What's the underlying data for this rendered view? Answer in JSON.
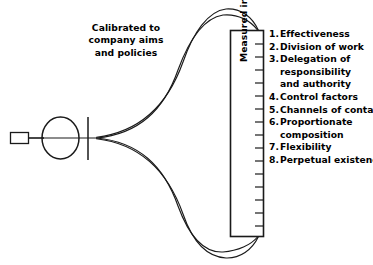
{
  "diagram": {
    "caption": {
      "lines": [
        "Calibrated to",
        "company aims",
        "and policies"
      ],
      "full_text": "Calibrated to company aims and policies"
    },
    "scale_box": {
      "vertical_label": "Measured in terms of objectives",
      "tick_count": 15
    },
    "objectives": [
      {
        "number": "1.",
        "lines": [
          "Effectiveness"
        ]
      },
      {
        "number": "2.",
        "lines": [
          "Division of work"
        ]
      },
      {
        "number": "3.",
        "lines": [
          "Delegation of",
          "responsibility",
          "and authority"
        ]
      },
      {
        "number": "4.",
        "lines": [
          "Control factors"
        ]
      },
      {
        "number": "5.",
        "lines": [
          "Channels of contact"
        ]
      },
      {
        "number": "6.",
        "lines": [
          "Proportionate",
          "composition"
        ]
      },
      {
        "number": "7.",
        "lines": [
          "Flexibility"
        ]
      },
      {
        "number": "8.",
        "lines": [
          "Perpetual existence"
        ]
      }
    ],
    "colors": {
      "stroke": "#1a1a1a",
      "background": "#ffffff",
      "text": "#000000"
    }
  }
}
